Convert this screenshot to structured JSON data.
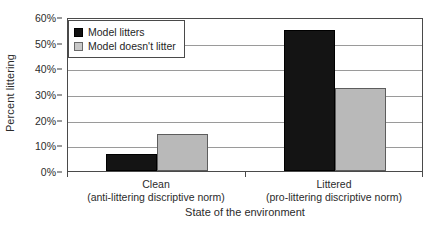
{
  "chart_data": {
    "type": "bar",
    "title": "",
    "xlabel": "State of the environment",
    "ylabel": "Percent littering",
    "ylim": [
      0,
      60
    ],
    "ytick_labels": [
      "0%",
      "10%",
      "20%",
      "30%",
      "40%",
      "50%",
      "60%"
    ],
    "ytick_values": [
      0,
      10,
      20,
      30,
      40,
      50,
      60
    ],
    "grid": true,
    "legend_position": "top-left",
    "categories": [
      "Clean",
      "Littered"
    ],
    "category_sublabels": [
      "(anti-littering discriptive norm)",
      "(pro-littering discriptive norm)"
    ],
    "series": [
      {
        "name": "Model litters",
        "color": "#141414",
        "values": [
          6.5,
          55.0
        ]
      },
      {
        "name": "Model doesn't litter",
        "color": "#b9b9b9",
        "values": [
          14.5,
          32.5
        ]
      }
    ]
  }
}
